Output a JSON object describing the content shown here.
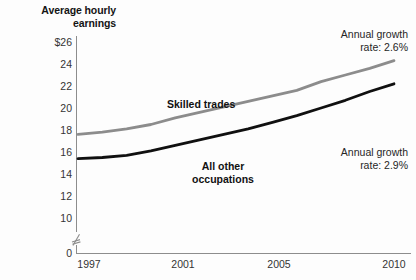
{
  "chart_data": {
    "type": "line",
    "title": "Average hourly earnings",
    "title_lines": [
      "Average hourly",
      "earnings"
    ],
    "xlabel": "",
    "ylabel": "Average hourly earnings",
    "grid": false,
    "legend_position": "inline-labels",
    "axis_break": true,
    "axis_break_note": "y-axis broken between 0 and 10",
    "xlim": [
      1997,
      2010
    ],
    "ylim": [
      10,
      26
    ],
    "y_ticks": [
      "$26",
      "24",
      "22",
      "20",
      "18",
      "16",
      "14",
      "12",
      "10",
      "0"
    ],
    "y_tick_values": [
      26,
      24,
      22,
      20,
      18,
      16,
      14,
      12,
      10,
      0
    ],
    "x_ticks": [
      "1997",
      "2001",
      "2005",
      "2010"
    ],
    "x_tick_values": [
      1997,
      2001,
      2005,
      2010
    ],
    "x": [
      1997,
      1998,
      1999,
      2000,
      2001,
      2002,
      2003,
      2004,
      2005,
      2006,
      2007,
      2008,
      2009,
      2010
    ],
    "series": [
      {
        "name": "Skilled trades",
        "color": "#8c8c8c",
        "values": [
          17.6,
          17.8,
          18.1,
          18.5,
          19.1,
          19.6,
          20.1,
          20.6,
          21.1,
          21.6,
          22.4,
          23.0,
          23.6,
          24.3
        ],
        "annotation_lines": [
          "Annual growth",
          "rate: 2.6%"
        ],
        "annotation": "Annual growth rate: 2.6%",
        "growth_rate": "2.6%"
      },
      {
        "name": "All other occupations",
        "name_lines": [
          "All other",
          "occupations"
        ],
        "color": "#101010",
        "values": [
          15.4,
          15.5,
          15.7,
          16.1,
          16.6,
          17.1,
          17.6,
          18.1,
          18.7,
          19.3,
          20.0,
          20.7,
          21.5,
          22.2
        ],
        "annotation_lines": [
          "Annual growth",
          "rate: 2.9%"
        ],
        "annotation": "Annual growth rate: 2.9%",
        "growth_rate": "2.9%"
      }
    ],
    "axis_color": "#8d8d8d",
    "text_color": "#262626"
  }
}
